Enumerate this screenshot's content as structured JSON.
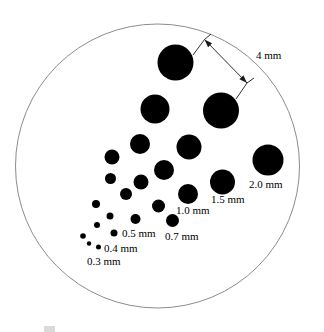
{
  "figure": {
    "type": "dot-size-reference-chart",
    "background_color": "#ffffff",
    "dot_color": "#000000",
    "outline_color": "#8c8c8c",
    "boundary": {
      "shape": "circle",
      "cx": 157.5,
      "cy": 166,
      "r": 142,
      "stroke_width": 1
    },
    "dots": [
      {
        "id": "dot-4-0-a",
        "label_value": "4 mm",
        "cx": 175.5,
        "cy": 62.5,
        "r": 18.0
      },
      {
        "id": "dot-4-0-b",
        "label_value": "4 mm",
        "cx": 221.0,
        "cy": 110.5,
        "r": 18.0
      },
      {
        "id": "dot-2-0",
        "label_value": "2.0 mm",
        "cx": 268.0,
        "cy": 160.0,
        "r": 15.5
      },
      {
        "id": "dot-3-0",
        "label_value": "3.0 mm",
        "cx": 155.0,
        "cy": 109.0,
        "r": 14.5
      },
      {
        "id": "dot-1-5",
        "label_value": "1.5 mm",
        "cx": 222.5,
        "cy": 182.0,
        "r": 12.5
      },
      {
        "id": "dot-2-5",
        "label_value": "2.5 mm",
        "cx": 189.0,
        "cy": 147.0,
        "r": 12.5
      },
      {
        "id": "dot-mid-a",
        "label_value": "",
        "cx": 140.0,
        "cy": 144.0,
        "r": 10.0
      },
      {
        "id": "dot-1-0",
        "label_value": "1.0 mm",
        "cx": 188.0,
        "cy": 194.0,
        "r": 10.0
      },
      {
        "id": "dot-mid-b",
        "label_value": "",
        "cx": 164.0,
        "cy": 170.0,
        "r": 10.0
      },
      {
        "id": "dot-mid-c",
        "label_value": "",
        "cx": 112.0,
        "cy": 157.0,
        "r": 7.5
      },
      {
        "id": "dot-mid-d",
        "label_value": "",
        "cx": 141.0,
        "cy": 182.0,
        "r": 7.5
      },
      {
        "id": "dot-0-7",
        "label_value": "0.7 mm",
        "cx": 172.5,
        "cy": 220.5,
        "r": 6.5
      },
      {
        "id": "dot-mid-e",
        "label_value": "",
        "cx": 158.5,
        "cy": 206.0,
        "r": 6.5
      },
      {
        "id": "dot-mid-f",
        "label_value": "",
        "cx": 126.0,
        "cy": 194.0,
        "r": 6.0
      },
      {
        "id": "dot-mid-g",
        "label_value": "",
        "cx": 110.5,
        "cy": 178.5,
        "r": 5.5
      },
      {
        "id": "dot-0-5",
        "label_value": "0.5 mm",
        "cx": 135.5,
        "cy": 219.0,
        "r": 5.0
      },
      {
        "id": "dot-sm-a",
        "label_value": "",
        "cx": 96.0,
        "cy": 204.0,
        "r": 4.0
      },
      {
        "id": "dot-sm-b",
        "label_value": "",
        "cx": 110.0,
        "cy": 216.0,
        "r": 3.5
      },
      {
        "id": "dot-0-4",
        "label_value": "0.4 mm",
        "cx": 114.0,
        "cy": 233.0,
        "r": 3.5
      },
      {
        "id": "dot-sm-c",
        "label_value": "",
        "cx": 97.0,
        "cy": 225.0,
        "r": 3.0
      },
      {
        "id": "dot-sm-d",
        "label_value": "",
        "cx": 83.0,
        "cy": 236.0,
        "r": 2.8
      },
      {
        "id": "dot-0-3",
        "label_value": "0.3 mm",
        "cx": 98.5,
        "cy": 247.0,
        "r": 2.5
      },
      {
        "id": "dot-sm-e",
        "label_value": "",
        "cx": 89.0,
        "cy": 243.5,
        "r": 2.2
      }
    ],
    "dimension": {
      "label": "4 mm",
      "from_dot": "dot-4-0-a",
      "to_dot": "dot-4-0-b",
      "leader_start": {
        "x": 193.0,
        "y": 55.0
      },
      "arrow_head_1": {
        "x": 204.5,
        "y": 39.5
      },
      "arrow_head_2": {
        "x": 247.0,
        "y": 83.0
      },
      "leader_end": {
        "x": 236.0,
        "y": 99.0
      },
      "extension_1_end": {
        "x": 211.0,
        "y": 34.0
      },
      "extension_2_end": {
        "x": 254.0,
        "y": 78.0
      }
    },
    "labels": [
      {
        "id": "label-4mm",
        "text": "4 mm",
        "x": 256,
        "y": 50,
        "align": "left"
      },
      {
        "id": "label-2-0mm",
        "text": "2.0 mm",
        "x": 249,
        "y": 179,
        "align": "left"
      },
      {
        "id": "label-1-5mm",
        "text": "1.5 mm",
        "x": 211,
        "y": 194,
        "align": "left"
      },
      {
        "id": "label-1-0mm",
        "text": "1.0 mm",
        "x": 176,
        "y": 205,
        "align": "left"
      },
      {
        "id": "label-0-7mm",
        "text": "0.7 mm",
        "x": 165,
        "y": 231,
        "align": "left"
      },
      {
        "id": "label-0-5mm",
        "text": "0.5 mm",
        "x": 122,
        "y": 228,
        "align": "left"
      },
      {
        "id": "label-0-4mm",
        "text": "0.4 mm",
        "x": 104,
        "y": 243,
        "align": "left"
      },
      {
        "id": "label-0-3mm",
        "text": "0.3 mm",
        "x": 87,
        "y": 256,
        "align": "left"
      }
    ],
    "caption": {
      "text": "",
      "visible": "partially-cropped"
    }
  }
}
